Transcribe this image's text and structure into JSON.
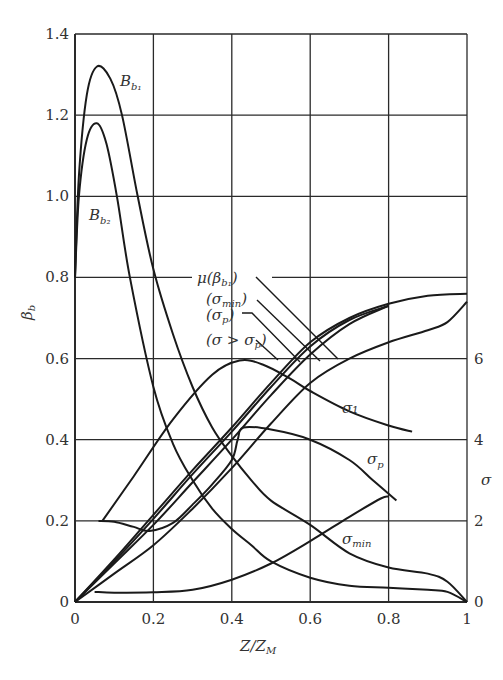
{
  "chart_data": {
    "type": "line",
    "title": "",
    "xlabel": "Z/Z_M",
    "ylabel": "β_b",
    "ylabel_right": "σ",
    "xlim": [
      0,
      1
    ],
    "ylim": [
      0,
      1.4
    ],
    "ylim_right": [
      0,
      14
    ],
    "grid": true,
    "x_ticks": [
      "0",
      "0.2",
      "0.4",
      "0.6",
      "0.8",
      "1"
    ],
    "y_ticks": [
      "0",
      "0.2",
      "0.4",
      "0.6",
      "0.8",
      "1.0",
      "1.2",
      "1.4"
    ],
    "y_right_ticks": [
      "0",
      "2",
      "4",
      "6"
    ],
    "series": [
      {
        "name": "B_b1",
        "axis": "left",
        "x": [
          0,
          0.01,
          0.03,
          0.056,
          0.09,
          0.12,
          0.16,
          0.2,
          0.25,
          0.3,
          0.35,
          0.4,
          0.45,
          0.5,
          0.6,
          0.7,
          0.8,
          0.9,
          0.95,
          1.0
        ],
        "y": [
          0.8,
          1.05,
          1.25,
          1.32,
          1.29,
          1.2,
          1.0,
          0.82,
          0.66,
          0.53,
          0.43,
          0.36,
          0.3,
          0.25,
          0.19,
          0.12,
          0.085,
          0.07,
          0.05,
          0.0
        ]
      },
      {
        "name": "B_b2",
        "axis": "left",
        "x": [
          0,
          0.01,
          0.03,
          0.056,
          0.08,
          0.107,
          0.14,
          0.2,
          0.25,
          0.3,
          0.35,
          0.4,
          0.45,
          0.5,
          0.6,
          0.7,
          0.8,
          0.9,
          0.95,
          1.0
        ],
        "y": [
          0.8,
          1.0,
          1.14,
          1.18,
          1.13,
          1.0,
          0.8,
          0.53,
          0.39,
          0.3,
          0.23,
          0.18,
          0.14,
          0.1,
          0.06,
          0.04,
          0.035,
          0.03,
          0.025,
          0.0
        ]
      },
      {
        "name": "σ1",
        "axis": "right",
        "x": [
          0.07,
          0.15,
          0.25,
          0.35,
          0.42,
          0.48,
          0.55,
          0.6,
          0.7,
          0.8,
          0.86
        ],
        "y": [
          2.0,
          3.1,
          4.5,
          5.6,
          5.95,
          5.85,
          5.5,
          5.2,
          4.7,
          4.35,
          4.2
        ]
      },
      {
        "name": "σp",
        "axis": "right",
        "x": [
          0.06,
          0.1,
          0.15,
          0.19,
          0.25,
          0.3,
          0.35,
          0.4,
          0.415,
          0.43,
          0.5,
          0.6,
          0.7,
          0.76,
          0.82
        ],
        "y": [
          2.0,
          1.98,
          1.85,
          1.75,
          1.95,
          2.4,
          2.9,
          3.5,
          4.0,
          4.3,
          4.25,
          4.0,
          3.5,
          3.0,
          2.5
        ]
      },
      {
        "name": "σmin",
        "axis": "right",
        "x": [
          0.05,
          0.1,
          0.2,
          0.3,
          0.4,
          0.5,
          0.6,
          0.7,
          0.78,
          0.8
        ],
        "y": [
          0.25,
          0.23,
          0.24,
          0.3,
          0.55,
          0.95,
          1.5,
          2.1,
          2.55,
          2.6
        ]
      },
      {
        "name": "μ(β_b1)",
        "axis": "left",
        "x": [
          0,
          0.1,
          0.2,
          0.3,
          0.4,
          0.5,
          0.6,
          0.7,
          0.8,
          0.9,
          1.0
        ],
        "y": [
          0,
          0.105,
          0.215,
          0.325,
          0.43,
          0.54,
          0.64,
          0.7,
          0.735,
          0.755,
          0.76
        ]
      },
      {
        "name": "(σmin)",
        "axis": "left",
        "x": [
          0,
          0.1,
          0.2,
          0.3,
          0.4,
          0.5,
          0.6,
          0.7,
          0.8
        ],
        "y": [
          0,
          0.1,
          0.205,
          0.315,
          0.42,
          0.53,
          0.63,
          0.695,
          0.73
        ]
      },
      {
        "name": "(σp)",
        "axis": "left",
        "x": [
          0,
          0.1,
          0.2,
          0.3,
          0.4,
          0.5,
          0.6,
          0.7,
          0.8
        ],
        "y": [
          0,
          0.095,
          0.19,
          0.295,
          0.4,
          0.51,
          0.61,
          0.685,
          0.73
        ]
      },
      {
        "name": "(σ>σp)",
        "axis": "left",
        "x": [
          0,
          0.1,
          0.2,
          0.3,
          0.4,
          0.5,
          0.6,
          0.7,
          0.8,
          0.9,
          0.95,
          1.0
        ],
        "y": [
          0,
          0.07,
          0.14,
          0.23,
          0.33,
          0.44,
          0.54,
          0.6,
          0.64,
          0.67,
          0.69,
          0.74
        ]
      }
    ],
    "annotations": [
      {
        "text": "B_b1",
        "x": 0.17,
        "y": 1.3
      },
      {
        "text": "B_b2",
        "x": 0.03,
        "y": 0.96
      },
      {
        "text": "σ1",
        "x": 0.66,
        "y": 0.49
      },
      {
        "text": "σp",
        "x": 0.68,
        "y": 0.37
      },
      {
        "text": "σmin",
        "x": 0.66,
        "y": 0.2
      },
      {
        "text": "μ(β_b1)",
        "x": 0.31,
        "y": 0.8
      },
      {
        "text": "(σmin)",
        "x": 0.32,
        "y": 0.74
      },
      {
        "text": "(σp)",
        "x": 0.32,
        "y": 0.69
      },
      {
        "text": "(σ>σp)",
        "x": 0.32,
        "y": 0.63
      }
    ],
    "legend": "inline leader-line labels"
  },
  "labels": {
    "xlabel_main": "Z/Z",
    "xlabel_sub": "M",
    "ylabel_main": "β",
    "ylabel_sub": "b",
    "ylabel_right": "σ",
    "Bb1_main": "B",
    "Bb1_sub": "b₁",
    "Bb2_main": "B",
    "Bb2_sub": "b₂",
    "sigma1": "σ₁",
    "sigmap_main": "σ",
    "sigmap_sub": "p",
    "sigmamin_main": "σ",
    "sigmamin_sub": "min",
    "leg_mu": "μ(β",
    "leg_mu_sub": "b₁",
    "leg_mu_close": ")",
    "leg_min": "(σ",
    "leg_min_sub": "min",
    "leg_min_close": ")",
    "leg_p": "(σ",
    "leg_p_sub": "p",
    "leg_p_close": ")",
    "leg_gt": "(σ > σ",
    "leg_gt_sub": "p",
    "leg_gt_close": ")"
  },
  "colors": {
    "line": "#1a1a1a",
    "grid": "#2a2a2a",
    "text": "#333333",
    "background": "#ffffff"
  }
}
